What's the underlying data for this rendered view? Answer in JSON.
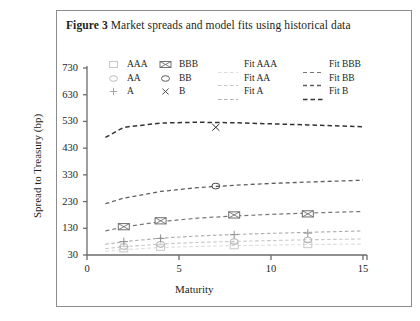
{
  "caption": {
    "label": "Figure 3",
    "text": "Market spreads and model fits using historical data"
  },
  "legend": {
    "markers": [
      {
        "name": "AAA",
        "glyph": "square-marker-icon"
      },
      {
        "name": "AA",
        "glyph": "circle-marker-icon"
      },
      {
        "name": "A",
        "glyph": "plus-marker-icon"
      },
      {
        "name": "BBB",
        "glyph": "boxed-x-marker-icon"
      },
      {
        "name": "BB",
        "glyph": "circle-marker-icon"
      },
      {
        "name": "B",
        "glyph": "cross-marker-icon"
      }
    ],
    "fits": [
      {
        "name": "Fit AAA"
      },
      {
        "name": "Fit AA"
      },
      {
        "name": "Fit A"
      },
      {
        "name": "Fit BBB"
      },
      {
        "name": "Fit BB"
      },
      {
        "name": "Fit B"
      }
    ]
  },
  "chart_data": {
    "type": "scatter",
    "title": "Market spreads and model fits using historical data",
    "xlabel": "Maturity",
    "ylabel": "Spread to Treasury (bp)",
    "xlim": [
      0,
      15
    ],
    "ylim": [
      30,
      730
    ],
    "xticks": [
      0,
      5,
      10,
      15
    ],
    "yticks": [
      30,
      130,
      230,
      330,
      430,
      530,
      630,
      730
    ],
    "grid": false,
    "legend_position": "top-inside",
    "colors": {
      "AAA": "#c9c9c9",
      "AA": "#b0b0b0",
      "A": "#909090",
      "BBB": "#6e6e6e",
      "BB": "#4a4a4a",
      "B": "#2a2a2a",
      "axis": "#6b6b6b",
      "frame": "#8c8c8c"
    },
    "series": [
      {
        "name": "AAA",
        "marker": "square",
        "points": [
          {
            "x": 2,
            "y": 52
          },
          {
            "x": 4,
            "y": 58
          },
          {
            "x": 8,
            "y": 64
          },
          {
            "x": 12,
            "y": 68
          }
        ]
      },
      {
        "name": "AA",
        "marker": "circle",
        "points": [
          {
            "x": 2,
            "y": 62
          },
          {
            "x": 4,
            "y": 70
          },
          {
            "x": 8,
            "y": 80
          },
          {
            "x": 12,
            "y": 86
          }
        ]
      },
      {
        "name": "A",
        "marker": "plus",
        "points": [
          {
            "x": 2,
            "y": 80
          },
          {
            "x": 4,
            "y": 92
          },
          {
            "x": 8,
            "y": 106
          },
          {
            "x": 12,
            "y": 112
          }
        ]
      },
      {
        "name": "BBB",
        "marker": "boxed-x",
        "points": [
          {
            "x": 2,
            "y": 136
          },
          {
            "x": 4,
            "y": 158
          },
          {
            "x": 8,
            "y": 180
          },
          {
            "x": 12,
            "y": 184
          }
        ]
      },
      {
        "name": "BB",
        "marker": "circle",
        "points": [
          {
            "x": 7,
            "y": 288
          }
        ]
      },
      {
        "name": "B",
        "marker": "cross",
        "points": [
          {
            "x": 7,
            "y": 508
          }
        ]
      }
    ],
    "fits": [
      {
        "name": "Fit AAA",
        "x": [
          1,
          2,
          4,
          6,
          8,
          10,
          12,
          15
        ],
        "y": [
          44,
          50,
          58,
          62,
          65,
          67,
          69,
          71
        ]
      },
      {
        "name": "Fit AA",
        "x": [
          1,
          2,
          4,
          6,
          8,
          10,
          12,
          15
        ],
        "y": [
          54,
          61,
          71,
          77,
          81,
          84,
          87,
          90
        ]
      },
      {
        "name": "Fit A",
        "x": [
          1,
          2,
          4,
          6,
          8,
          10,
          12,
          15
        ],
        "y": [
          70,
          80,
          93,
          101,
          107,
          111,
          115,
          120
        ]
      },
      {
        "name": "Fit BBB",
        "x": [
          1,
          2,
          4,
          6,
          8,
          10,
          12,
          15
        ],
        "y": [
          120,
          135,
          155,
          168,
          176,
          182,
          187,
          193
        ]
      },
      {
        "name": "Fit BB",
        "x": [
          1,
          2,
          4,
          6,
          8,
          10,
          12,
          15
        ],
        "y": [
          222,
          243,
          268,
          282,
          291,
          298,
          303,
          310
        ]
      },
      {
        "name": "Fit B",
        "x": [
          1,
          2,
          4,
          6,
          8,
          10,
          12,
          15
        ],
        "y": [
          470,
          508,
          524,
          527,
          525,
          521,
          517,
          510
        ]
      }
    ]
  }
}
